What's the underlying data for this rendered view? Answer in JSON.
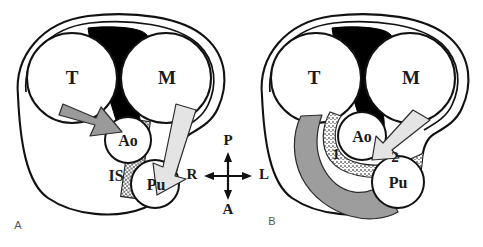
{
  "figure": {
    "panels": [
      {
        "letter": "A",
        "labels": {
          "trachea_left": "T",
          "mass_right": "M",
          "aorta": "Ao",
          "pulmonary": "Pu",
          "interlobar_septum": "IS"
        },
        "arrows": [
          {
            "name": "dark-approach-arrow",
            "tone": "#9a9a9a",
            "direction": "down-right",
            "target": "Ao"
          },
          {
            "name": "light-approach-arrow",
            "tone": "#e4e4e4",
            "direction": "down-left",
            "target": "Pu"
          }
        ]
      },
      {
        "letter": "B",
        "labels": {
          "trachea_left": "T",
          "mass_right": "M",
          "aorta": "Ao",
          "pulmonary": "Pu",
          "route_one": "1",
          "route_two": "2"
        },
        "arrows": [
          {
            "name": "curved-sweep-arrow",
            "tone": "#9d9d9d",
            "direction": "counterclockwise-sweep",
            "target": "Pu"
          },
          {
            "name": "light-approach-arrow",
            "tone": "#e4e4e4",
            "direction": "down-left",
            "target": "Ao"
          }
        ]
      }
    ],
    "compass": {
      "name": "orientation-compass",
      "posterior": "P",
      "anterior": "A",
      "right": "R",
      "left": "L"
    },
    "colors": {
      "black_mass": "#000000",
      "outline": "#111111",
      "arrow_dark": "#9a9a9a",
      "arrow_light": "#e4e4e4",
      "stipple_band": "#8f8f8f",
      "background": "#ffffff"
    }
  }
}
